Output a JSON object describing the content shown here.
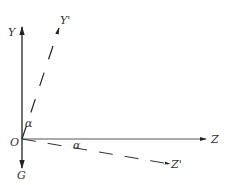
{
  "diagram": {
    "axes": {
      "y": "Y",
      "y_prime": "Y'",
      "z": "Z",
      "z_prime": "Z'",
      "g": "G",
      "origin": "O"
    },
    "angles": {
      "upper": "α",
      "lower": "α"
    },
    "colors": {
      "line": "#222222",
      "text": "#333333"
    }
  }
}
